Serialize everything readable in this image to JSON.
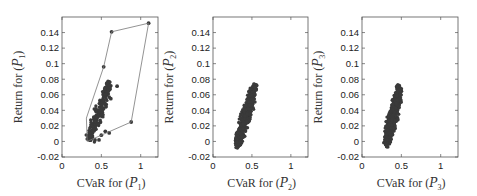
{
  "chart_data": [
    {
      "type": "scatter",
      "panel": 1,
      "xlabel": "CVaR for (P1)",
      "ylabel": "Return for (P1)",
      "xlim": [
        0,
        1.22
      ],
      "ylim": [
        -0.02,
        0.16
      ],
      "xticks": [
        0,
        0.5,
        1
      ],
      "xtick_labels": [
        "0",
        "0.5",
        "1"
      ],
      "yticks": [
        -0.02,
        0,
        0.02,
        0.04,
        0.06,
        0.08,
        0.1,
        0.12,
        0.14
      ],
      "ytick_labels": [
        "-0.02",
        "0",
        "0.02",
        "0.04",
        "0.06",
        "0.08",
        "0.1",
        "0.12",
        "0.14"
      ],
      "grid": false,
      "hull": [
        [
          0.32,
          0.0
        ],
        [
          0.88,
          0.025
        ],
        [
          1.1,
          0.152
        ],
        [
          0.63,
          0.141
        ],
        [
          0.53,
          0.096
        ],
        [
          0.31,
          0.03
        ]
      ],
      "cluster": {
        "x_range": [
          0.3,
          0.66
        ],
        "y_range": [
          0.0,
          0.075
        ],
        "slope": 0.16,
        "seed": 11,
        "count": 230
      },
      "outliers": [
        [
          0.53,
          0.096
        ],
        [
          0.63,
          0.141
        ],
        [
          1.1,
          0.152
        ],
        [
          0.88,
          0.025
        ],
        [
          0.7,
          0.071
        ],
        [
          0.57,
          0.075
        ],
        [
          0.6,
          0.057
        ],
        [
          0.62,
          0.055
        ],
        [
          0.47,
          0.002
        ],
        [
          0.42,
          0.002
        ],
        [
          0.5,
          0.008
        ],
        [
          0.55,
          0.013
        ],
        [
          0.6,
          0.011
        ]
      ]
    },
    {
      "type": "scatter",
      "panel": 2,
      "xlabel": "CVaR for (P2)",
      "ylabel": "Return for (P2)",
      "xlim": [
        0,
        1.22
      ],
      "ylim": [
        -0.02,
        0.16
      ],
      "xticks": [
        0,
        0.5,
        1
      ],
      "xtick_labels": [
        "0",
        "0.5",
        "1"
      ],
      "yticks": [
        -0.02,
        0,
        0.02,
        0.04,
        0.06,
        0.08,
        0.1,
        0.12,
        0.14
      ],
      "ytick_labels": [
        "-0.02",
        "0",
        "0.02",
        "0.04",
        "0.06",
        "0.08",
        "0.1",
        "0.12",
        "0.14"
      ],
      "grid": false,
      "cluster": {
        "x_range": [
          0.27,
          0.6
        ],
        "y_range": [
          -0.005,
          0.072
        ],
        "seed": 23,
        "count": 600
      }
    },
    {
      "type": "scatter",
      "panel": 3,
      "xlabel": "CVaR for (P3)",
      "ylabel": "Return for (P3)",
      "xlim": [
        0,
        1.22
      ],
      "ylim": [
        -0.02,
        0.16
      ],
      "xticks": [
        0,
        0.5,
        1
      ],
      "xtick_labels": [
        "0",
        "0.5",
        "1"
      ],
      "yticks": [
        -0.02,
        0,
        0.02,
        0.04,
        0.06,
        0.08,
        0.1,
        0.12,
        0.14
      ],
      "ytick_labels": [
        "-0.02",
        "0",
        "0.02",
        "0.04",
        "0.06",
        "0.08",
        "0.1",
        "0.12",
        "0.14"
      ],
      "grid": false,
      "cluster": {
        "x_range": [
          0.27,
          0.54
        ],
        "y_range": [
          -0.004,
          0.069
        ],
        "seed": 37,
        "count": 600
      }
    }
  ],
  "panels": [
    {
      "xlabel_main": "CVaR for (",
      "xlabel_sym": "P",
      "xlabel_sub": "1",
      "ylabel_main": "Return for (",
      "ylabel_sym": "P",
      "ylabel_sub": "1"
    },
    {
      "xlabel_main": "CVaR for (",
      "xlabel_sym": "P",
      "xlabel_sub": "2",
      "ylabel_main": "Return for (",
      "ylabel_sym": "P",
      "ylabel_sub": "2"
    },
    {
      "xlabel_main": "CVaR for (",
      "xlabel_sym": "P",
      "xlabel_sub": "3",
      "ylabel_main": "Return for (",
      "ylabel_sym": "P",
      "ylabel_sub": "3"
    }
  ],
  "colors": {
    "marker": "#3a3a3a",
    "hull": "#777777",
    "axis": "#555555"
  }
}
